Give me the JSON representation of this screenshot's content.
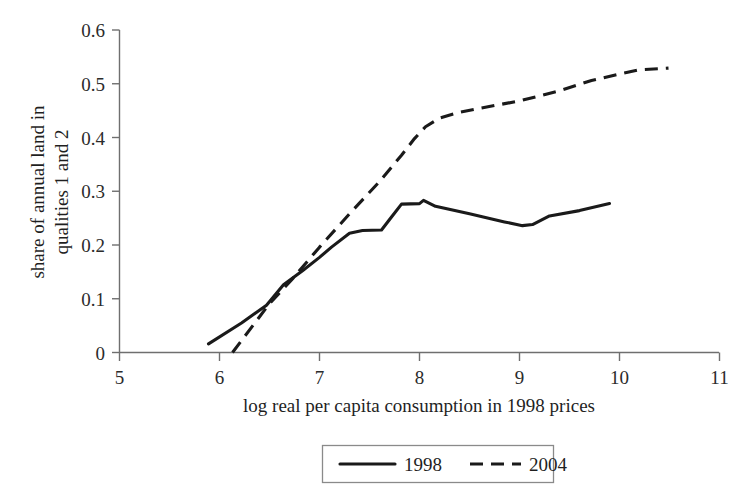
{
  "chart_data": {
    "type": "line",
    "title": "",
    "xlabel": "log real per capita consumption in 1998 prices",
    "ylabel": "share of annual land in qualities 1 and 2",
    "ylabel_line1": "share of annual land in",
    "ylabel_line2": "qualities 1 and 2",
    "xlim": [
      5,
      11
    ],
    "ylim": [
      0,
      0.6
    ],
    "xticks": [
      "5",
      "6",
      "7",
      "8",
      "9",
      "10",
      "11"
    ],
    "xtick_values": [
      5,
      6,
      7,
      8,
      9,
      10,
      11
    ],
    "yticks": [
      "0",
      "0.1",
      "0.2",
      "0.3",
      "0.4",
      "0.5",
      "0.6"
    ],
    "ytick_values": [
      0,
      0.1,
      0.2,
      0.3,
      0.4,
      0.5,
      0.6
    ],
    "grid": false,
    "legend_position": "bottom-center",
    "series": [
      {
        "name": "1998",
        "style": "solid",
        "color": "#1a1a1a",
        "points": [
          [
            5.89,
            0.016
          ],
          [
            6.22,
            0.055
          ],
          [
            6.47,
            0.088
          ],
          [
            6.64,
            0.126
          ],
          [
            6.83,
            0.152
          ],
          [
            7.0,
            0.177
          ],
          [
            7.12,
            0.196
          ],
          [
            7.3,
            0.222
          ],
          [
            7.43,
            0.227
          ],
          [
            7.62,
            0.228
          ],
          [
            7.72,
            0.252
          ],
          [
            7.82,
            0.276
          ],
          [
            8.0,
            0.277
          ],
          [
            8.04,
            0.283
          ],
          [
            8.16,
            0.272
          ],
          [
            8.5,
            0.258
          ],
          [
            8.85,
            0.243
          ],
          [
            9.03,
            0.236
          ],
          [
            9.13,
            0.238
          ],
          [
            9.3,
            0.254
          ],
          [
            9.6,
            0.264
          ],
          [
            9.9,
            0.277
          ]
        ]
      },
      {
        "name": "2004",
        "style": "dashed",
        "color": "#1a1a1a",
        "points": [
          [
            6.13,
            0.0
          ],
          [
            6.5,
            0.091
          ],
          [
            6.72,
            0.135
          ],
          [
            7.0,
            0.196
          ],
          [
            7.3,
            0.258
          ],
          [
            7.6,
            0.318
          ],
          [
            7.82,
            0.367
          ],
          [
            7.95,
            0.398
          ],
          [
            8.06,
            0.42
          ],
          [
            8.2,
            0.436
          ],
          [
            8.4,
            0.447
          ],
          [
            8.62,
            0.455
          ],
          [
            9.0,
            0.468
          ],
          [
            9.4,
            0.487
          ],
          [
            9.72,
            0.506
          ],
          [
            10.0,
            0.518
          ],
          [
            10.2,
            0.526
          ],
          [
            10.49,
            0.529
          ]
        ]
      }
    ],
    "legend": [
      {
        "label": "1998",
        "style": "solid"
      },
      {
        "label": "2004",
        "style": "dashed"
      }
    ]
  }
}
